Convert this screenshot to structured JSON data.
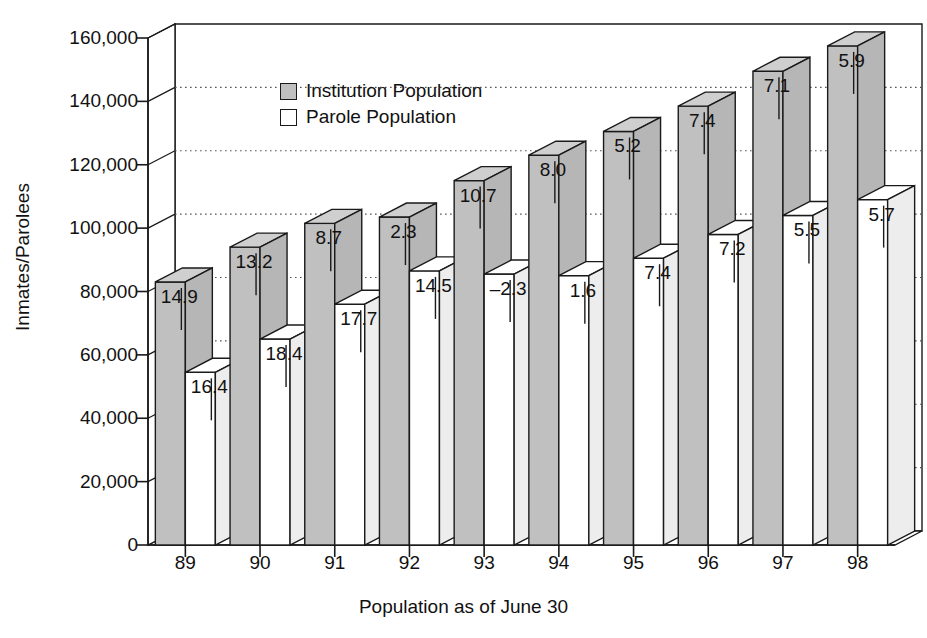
{
  "chart_data": {
    "type": "bar",
    "title": "",
    "xlabel": "Population as of June 30",
    "ylabel": "Inmates/Parolees",
    "categories": [
      "89",
      "90",
      "91",
      "92",
      "93",
      "94",
      "95",
      "96",
      "97",
      "98"
    ],
    "ylim": [
      0,
      160000
    ],
    "yticks": [
      "0",
      "20,000",
      "40,000",
      "60,000",
      "80,000",
      "100,000",
      "120,000",
      "140,000",
      "160,000"
    ],
    "ytick_values": [
      0,
      20000,
      40000,
      60000,
      80000,
      100000,
      120000,
      140000,
      160000
    ],
    "grid": true,
    "legend_position": "upper-left-inside",
    "style": "3d-column",
    "series": [
      {
        "name": "Institution Population",
        "color": "#c0c0c0",
        "values": [
          83000,
          94000,
          101500,
          103500,
          115000,
          123000,
          130500,
          138500,
          149500,
          157500
        ],
        "labels": [
          "14.9",
          "13.2",
          "8.7",
          "2.3",
          "10.7",
          "8.0",
          "5.2",
          "7.4",
          "7.1",
          "5.9"
        ]
      },
      {
        "name": "Parole Population",
        "color": "#ffffff",
        "values": [
          54500,
          65000,
          76000,
          86500,
          85500,
          85000,
          90500,
          98000,
          104000,
          109000
        ],
        "labels": [
          "16.4",
          "18.4",
          "17.7",
          "14.5",
          "–2.3",
          "1.6",
          "7.4",
          "7.2",
          "5.5",
          "5.7"
        ]
      }
    ]
  },
  "legend": {
    "entries": [
      {
        "label": "Institution Population",
        "swatch": "gray"
      },
      {
        "label": "Parole Population",
        "swatch": "white"
      }
    ]
  },
  "axes": {
    "y_title": "Inmates/Parolees",
    "x_title": "Population as of June 30"
  }
}
